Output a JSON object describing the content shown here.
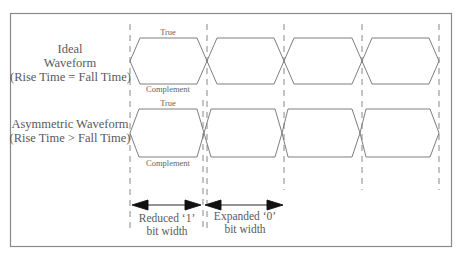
{
  "diagram": {
    "rows": [
      {
        "id": "ideal",
        "title_lines": [
          "Ideal",
          "Waveform",
          "(Rise Time = Fall Time)"
        ],
        "true_label": "True",
        "complement_label": "Complement"
      },
      {
        "id": "asymmetric",
        "title_lines": [
          "Asymmetric Waveform",
          "(Rise Time > Fall Time)"
        ],
        "true_label": "True",
        "complement_label": "Complement"
      }
    ],
    "annotations": [
      {
        "id": "reduced",
        "lines": [
          "Reduced ‘1’",
          "bit width"
        ]
      },
      {
        "id": "expanded",
        "lines": [
          "Expanded ‘0’",
          "bit width"
        ]
      }
    ],
    "colors": {
      "frame": "#8a8a8a",
      "waveform": "#6f6f6f",
      "dashed": "#7a7a7a",
      "arrow": "#111111",
      "text": "#5a5a5a"
    }
  }
}
